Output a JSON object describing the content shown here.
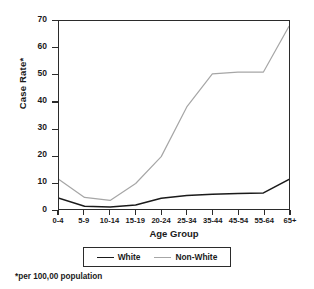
{
  "chart_data": {
    "type": "line",
    "title": "",
    "xlabel": "Age Group",
    "ylabel": "Case Rate*",
    "footnote": "*per 100,00 population",
    "categories": [
      "0-4",
      "5-9",
      "10-14",
      "15-19",
      "20-24",
      "25-34",
      "35-44",
      "45-54",
      "55-64",
      "65+"
    ],
    "ylim": [
      0,
      70
    ],
    "yticks": [
      0,
      10,
      20,
      30,
      40,
      50,
      60,
      70
    ],
    "grid": false,
    "legend_position": "bottom",
    "series": [
      {
        "name": "White",
        "color": "#1a1a1a",
        "values": [
          4,
          1,
          0.7,
          1.5,
          4,
          5,
          5.5,
          5.8,
          6,
          11
        ]
      },
      {
        "name": "Non-White",
        "color": "#a6a6a6",
        "values": [
          11,
          4.3,
          3.2,
          9.5,
          19.5,
          38,
          50.3,
          51,
          51,
          68
        ]
      }
    ]
  },
  "axes": {
    "ylabel": "Case Rate*",
    "xlabel": "Age Group"
  },
  "legend": {
    "items": [
      {
        "label": "White",
        "color": "#1a1a1a"
      },
      {
        "label": "Non-White",
        "color": "#a6a6a6"
      }
    ]
  },
  "footnote": {
    "text": "*per 100,00 population"
  }
}
